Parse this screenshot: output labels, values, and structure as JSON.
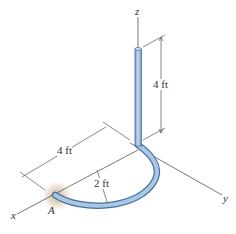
{
  "diagram": {
    "axes": {
      "z": "z",
      "y": "y",
      "x": "x"
    },
    "point_label": "A",
    "dimensions": {
      "vertical_length": "4 ft",
      "horizontal_length": "4 ft",
      "radius": "2 ft"
    },
    "colors": {
      "pipe_fill": "#9fc3e6",
      "pipe_stroke": "#4a6f95",
      "axis_line": "#555555",
      "glow": "#c9a98a"
    }
  }
}
